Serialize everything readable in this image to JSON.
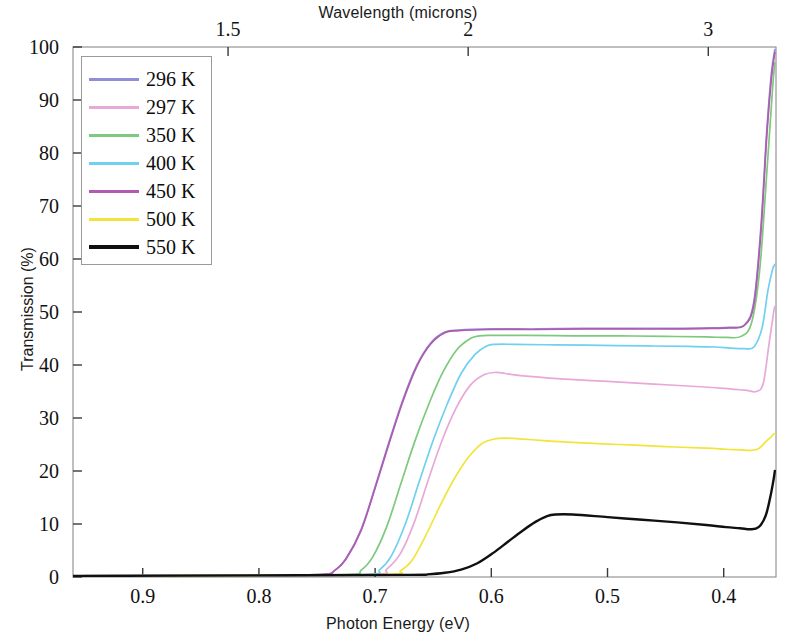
{
  "chart_data": {
    "type": "line",
    "title": "",
    "xlabel": "Photon Energy (eV)",
    "ylabel": "Transmission (%)",
    "secondary_xlabel": "Wavelength (microns)",
    "xlim": [
      0.96,
      0.355
    ],
    "ylim": [
      0,
      100
    ],
    "x_ticks": [
      "0.9",
      "0.8",
      "0.7",
      "0.6",
      "0.5",
      "0.4"
    ],
    "x_tick_values": [
      0.9,
      0.8,
      0.7,
      0.6,
      0.5,
      0.4
    ],
    "secondary_x_ticks": [
      "1.5",
      "2",
      "3"
    ],
    "secondary_x_tick_values": [
      1.5,
      2,
      3
    ],
    "y_ticks": [
      "0",
      "10",
      "20",
      "30",
      "40",
      "50",
      "60",
      "70",
      "80",
      "90",
      "100"
    ],
    "y_tick_values": [
      0,
      10,
      20,
      30,
      40,
      50,
      60,
      70,
      80,
      90,
      100
    ],
    "grid": false,
    "axis_direction": "x-reversed",
    "legend_position": "upper-left",
    "series": [
      {
        "name": "296 K",
        "color": "#8f8fd8",
        "x": [
          0.96,
          0.8,
          0.745,
          0.735,
          0.725,
          0.712,
          0.7,
          0.688,
          0.676,
          0.664,
          0.652,
          0.64,
          0.628,
          0.6,
          0.56,
          0.52,
          0.48,
          0.44,
          0.41,
          0.395,
          0.382,
          0.374,
          0.368,
          0.363,
          0.359,
          0.356
        ],
        "y": [
          0.2,
          0.3,
          0.5,
          1.2,
          3.5,
          9.0,
          17.0,
          25.5,
          33.5,
          40.0,
          44.2,
          46.2,
          46.6,
          46.8,
          46.8,
          46.9,
          46.9,
          46.9,
          47.0,
          47.1,
          47.6,
          52.0,
          66.0,
          84.0,
          95.0,
          99.5
        ]
      },
      {
        "name": "297 K",
        "color": "#e8a8d8",
        "x": [
          0.96,
          0.8,
          0.7,
          0.69,
          0.678,
          0.666,
          0.654,
          0.642,
          0.63,
          0.618,
          0.606,
          0.596,
          0.588,
          0.575,
          0.54,
          0.5,
          0.46,
          0.42,
          0.4,
          0.39,
          0.38,
          0.372,
          0.366,
          0.361,
          0.357,
          0.356
        ],
        "y": [
          0.2,
          0.3,
          0.5,
          1.5,
          4.5,
          10.5,
          18.5,
          26.0,
          32.0,
          36.2,
          38.2,
          38.6,
          38.4,
          38.0,
          37.4,
          36.9,
          36.4,
          35.9,
          35.6,
          35.4,
          35.2,
          35.0,
          36.5,
          44.0,
          50.0,
          51.0
        ]
      },
      {
        "name": "350 K",
        "color": "#7dc97d",
        "x": [
          0.96,
          0.8,
          0.722,
          0.712,
          0.702,
          0.69,
          0.678,
          0.666,
          0.654,
          0.642,
          0.63,
          0.618,
          0.61,
          0.6,
          0.57,
          0.53,
          0.49,
          0.45,
          0.415,
          0.398,
          0.385,
          0.376,
          0.369,
          0.363,
          0.358,
          0.356
        ],
        "y": [
          0.2,
          0.3,
          0.5,
          1.3,
          3.8,
          9.5,
          17.5,
          25.5,
          32.5,
          38.5,
          42.8,
          45.0,
          45.5,
          45.6,
          45.6,
          45.5,
          45.5,
          45.4,
          45.3,
          45.2,
          45.4,
          48.0,
          58.0,
          76.0,
          92.0,
          97.0
        ]
      },
      {
        "name": "400 K",
        "color": "#6fd0f0",
        "x": [
          0.96,
          0.8,
          0.706,
          0.696,
          0.686,
          0.674,
          0.662,
          0.65,
          0.638,
          0.626,
          0.614,
          0.604,
          0.596,
          0.58,
          0.545,
          0.505,
          0.465,
          0.43,
          0.408,
          0.394,
          0.383,
          0.374,
          0.367,
          0.362,
          0.358,
          0.356
        ],
        "y": [
          0.2,
          0.3,
          0.5,
          1.4,
          4.0,
          10.0,
          18.0,
          25.8,
          32.6,
          38.4,
          42.0,
          43.6,
          43.9,
          43.9,
          43.8,
          43.7,
          43.6,
          43.5,
          43.4,
          43.2,
          43.1,
          43.4,
          47.0,
          54.0,
          58.0,
          59.0
        ]
      },
      {
        "name": "450 K",
        "color": "#b05ab0",
        "x": [
          0.96,
          0.8,
          0.745,
          0.735,
          0.725,
          0.712,
          0.7,
          0.688,
          0.676,
          0.664,
          0.652,
          0.64,
          0.628,
          0.6,
          0.56,
          0.52,
          0.48,
          0.44,
          0.41,
          0.395,
          0.382,
          0.374,
          0.368,
          0.363,
          0.359,
          0.356
        ],
        "y": [
          0.2,
          0.3,
          0.5,
          1.2,
          3.4,
          8.8,
          16.8,
          25.2,
          33.2,
          39.8,
          44.0,
          46.1,
          46.5,
          46.7,
          46.7,
          46.8,
          46.8,
          46.8,
          46.9,
          47.0,
          47.5,
          51.5,
          65.0,
          83.0,
          94.0,
          99.0
        ]
      },
      {
        "name": "500 K",
        "color": "#f2e43a",
        "x": [
          0.96,
          0.8,
          0.688,
          0.678,
          0.668,
          0.656,
          0.644,
          0.632,
          0.62,
          0.608,
          0.596,
          0.586,
          0.578,
          0.565,
          0.53,
          0.49,
          0.45,
          0.415,
          0.398,
          0.386,
          0.377,
          0.37,
          0.364,
          0.359,
          0.357,
          0.356
        ],
        "y": [
          0.2,
          0.3,
          0.5,
          1.2,
          3.2,
          8.0,
          13.5,
          18.5,
          22.5,
          25.2,
          26.1,
          26.2,
          26.1,
          25.9,
          25.4,
          25.0,
          24.6,
          24.3,
          24.1,
          24.0,
          23.9,
          24.2,
          25.5,
          26.5,
          27.0,
          27.0
        ]
      },
      {
        "name": "550 K",
        "color": "#101010",
        "x": [
          0.96,
          0.8,
          0.67,
          0.655,
          0.64,
          0.626,
          0.612,
          0.598,
          0.586,
          0.574,
          0.562,
          0.552,
          0.545,
          0.53,
          0.5,
          0.47,
          0.44,
          0.415,
          0.398,
          0.386,
          0.377,
          0.37,
          0.364,
          0.36,
          0.357,
          0.356
        ],
        "y": [
          0.2,
          0.3,
          0.4,
          0.5,
          0.8,
          1.4,
          2.6,
          4.6,
          6.6,
          8.6,
          10.4,
          11.5,
          11.8,
          11.8,
          11.3,
          10.8,
          10.3,
          9.8,
          9.4,
          9.2,
          9.0,
          9.4,
          11.5,
          15.0,
          18.5,
          20.0
        ]
      }
    ]
  },
  "legend": {
    "items": [
      {
        "label": "296 K",
        "color": "#8f8fd8"
      },
      {
        "label": "297 K",
        "color": "#e8a8d8"
      },
      {
        "label": "350 K",
        "color": "#7dc97d"
      },
      {
        "label": "400 K",
        "color": "#6fd0f0"
      },
      {
        "label": "450 K",
        "color": "#b05ab0"
      },
      {
        "label": "500 K",
        "color": "#f2e43a"
      },
      {
        "label": "550 K",
        "color": "#101010"
      }
    ]
  },
  "axes": {
    "top_title": "Wavelength (microns)",
    "bottom_title": "Photon Energy (eV)",
    "left_title": "Transmission (%)"
  }
}
